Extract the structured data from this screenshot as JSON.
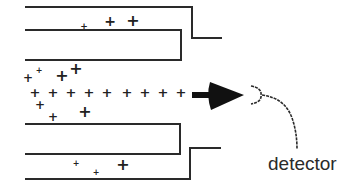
{
  "diagram": {
    "type": "ion beam toward detector between electrode plates",
    "stroke_color": "#2a2a2a",
    "labels": {
      "detector": "detector"
    },
    "ions": {
      "symbol": "+",
      "beam_row": [
        {
          "x": 35,
          "y": 92
        },
        {
          "x": 53,
          "y": 92
        },
        {
          "x": 71,
          "y": 92
        },
        {
          "x": 89,
          "y": 92
        },
        {
          "x": 107,
          "y": 92
        },
        {
          "x": 127,
          "y": 92
        },
        {
          "x": 145,
          "y": 92
        },
        {
          "x": 163,
          "y": 92
        },
        {
          "x": 181,
          "y": 92
        }
      ],
      "scattered": [
        {
          "x": 84,
          "y": 26,
          "size": 9
        },
        {
          "x": 110,
          "y": 21,
          "size": 14
        },
        {
          "x": 133,
          "y": 21,
          "size": 16
        },
        {
          "x": 28,
          "y": 78,
          "size": 12
        },
        {
          "x": 39,
          "y": 71,
          "size": 8
        },
        {
          "x": 62,
          "y": 76,
          "size": 16
        },
        {
          "x": 76,
          "y": 69,
          "size": 16
        },
        {
          "x": 40,
          "y": 105,
          "size": 12
        },
        {
          "x": 53,
          "y": 117,
          "size": 12
        },
        {
          "x": 85,
          "y": 112,
          "size": 16
        },
        {
          "x": 76,
          "y": 164,
          "size": 8
        },
        {
          "x": 96,
          "y": 173,
          "size": 8
        },
        {
          "x": 123,
          "y": 165,
          "size": 16
        }
      ]
    }
  }
}
